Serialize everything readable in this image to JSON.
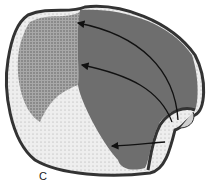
{
  "figure": {
    "panel_label": "C",
    "arrows": 3,
    "colors": {
      "outline": "#333333",
      "dark_region": "#6e6e6e",
      "stippled_region": "#9a9a9a",
      "light_region": "#e6e6e6",
      "background": "#ffffff"
    }
  }
}
